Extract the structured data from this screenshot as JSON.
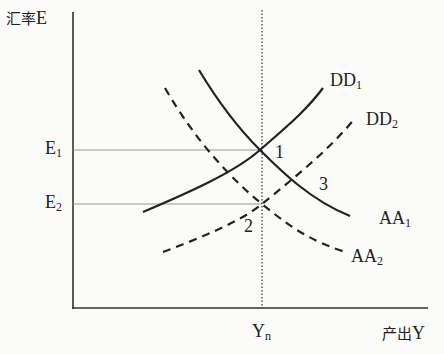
{
  "axes": {
    "y_label_cn": "汇率",
    "y_label_sym": "E",
    "x_label_cn": "产出",
    "x_label_sym": "Y"
  },
  "ticks": {
    "e1": {
      "base": "E",
      "sub": "1"
    },
    "e2": {
      "base": "E",
      "sub": "2"
    },
    "yn": {
      "base": "Y",
      "sub": "n"
    }
  },
  "curves": {
    "dd1": {
      "base": "DD",
      "sub": "1",
      "style": "solid"
    },
    "dd2": {
      "base": "DD",
      "sub": "2",
      "style": "dashed"
    },
    "aa1": {
      "base": "AA",
      "sub": "1",
      "style": "solid"
    },
    "aa2": {
      "base": "AA",
      "sub": "2",
      "style": "dashed"
    }
  },
  "points": {
    "p1": "1",
    "p2": "2",
    "p3": "3"
  },
  "colors": {
    "ink": "#222222",
    "guide": "#999999",
    "background": "#fbfbf9"
  }
}
